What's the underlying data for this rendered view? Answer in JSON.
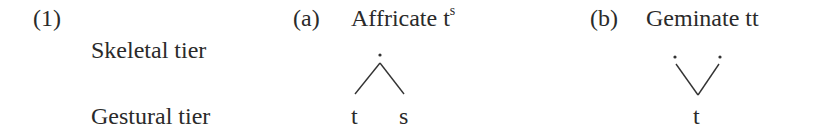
{
  "example": {
    "number": "(1)",
    "row_labels": {
      "skeletal": "Skeletal tier",
      "gestural": "Gestural tier"
    },
    "panels": [
      {
        "label": "(a)",
        "title": "Affricate t",
        "title_superscript": "s",
        "skeletal_slots": 1,
        "gestural_segments": [
          "t",
          "s"
        ]
      },
      {
        "label": "(b)",
        "title": "Geminate tt",
        "skeletal_slots": 2,
        "gestural_segments": [
          "t"
        ]
      }
    ]
  },
  "colors": {
    "text": "#2a2a2a",
    "lines": "#333333"
  }
}
